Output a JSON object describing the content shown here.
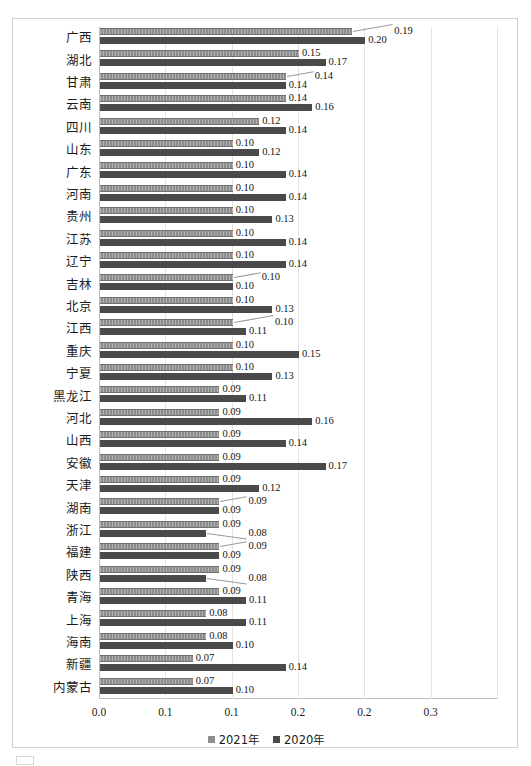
{
  "chart_data": {
    "type": "bar",
    "orientation": "horizontal",
    "title": "",
    "xlabel": "",
    "ylabel": "",
    "xlim": [
      0,
      0.3
    ],
    "xticks": [
      "0.0",
      "0.1",
      "0.1",
      "0.2",
      "0.2",
      "0.3"
    ],
    "xtick_values": [
      0.0,
      0.05,
      0.1,
      0.15,
      0.2,
      0.25,
      0.3
    ],
    "grid": true,
    "legend_position": "bottom",
    "categories": [
      "广西",
      "湖北",
      "甘肃",
      "云南",
      "四川",
      "山东",
      "广东",
      "河南",
      "贵州",
      "江苏",
      "辽宁",
      "吉林",
      "北京",
      "江西",
      "重庆",
      "宁夏",
      "黑龙江",
      "河北",
      "山西",
      "安徽",
      "天津",
      "湖南",
      "浙江",
      "福建",
      "陕西",
      "青海",
      "上海",
      "海南",
      "新疆",
      "内蒙古"
    ],
    "series": [
      {
        "name": "2021年",
        "color": "#8e8e8e",
        "values": [
          0.19,
          0.15,
          0.14,
          0.14,
          0.12,
          0.1,
          0.1,
          0.1,
          0.1,
          0.1,
          0.1,
          0.1,
          0.1,
          0.1,
          0.1,
          0.1,
          0.09,
          0.09,
          0.09,
          0.09,
          0.09,
          0.09,
          0.09,
          0.09,
          0.09,
          0.09,
          0.08,
          0.08,
          0.07,
          0.07
        ],
        "labels": [
          "0.19",
          "0.15",
          "0.14",
          "0.14",
          "0.12",
          "0.10",
          "0.10",
          "0.10",
          "0.10",
          "0.10",
          "0.10",
          "0.10",
          "0.10",
          "0.10",
          "0.10",
          "0.10",
          "0.09",
          "0.09",
          "0.09",
          "0.09",
          "0.09",
          "0.09",
          "0.09",
          "0.09",
          "0.09",
          "0.09",
          "0.08",
          "0.08",
          "0.07",
          "0.07"
        ]
      },
      {
        "name": "2020年",
        "color": "#4a4a4a",
        "values": [
          0.2,
          0.17,
          0.14,
          0.16,
          0.14,
          0.12,
          0.14,
          0.14,
          0.13,
          0.14,
          0.14,
          0.1,
          0.13,
          0.11,
          0.15,
          0.13,
          0.11,
          0.16,
          0.14,
          0.17,
          0.12,
          0.09,
          0.08,
          0.09,
          0.08,
          0.11,
          0.11,
          0.1,
          0.14,
          0.1
        ],
        "labels": [
          "0.20",
          "0.17",
          "0.14",
          "0.16",
          "0.14",
          "0.12",
          "0.14",
          "0.14",
          "0.13",
          "0.14",
          "0.14",
          "0.10",
          "0.13",
          "0.11",
          "0.15",
          "0.13",
          "0.11",
          "0.16",
          "0.14",
          "0.17",
          "0.12",
          "0.09",
          "0.08",
          "0.09",
          "0.08",
          "0.11",
          "0.11",
          "0.10",
          "0.14",
          "0.10"
        ]
      }
    ]
  },
  "legend": {
    "items": [
      {
        "label": "2021年",
        "swatch": "swatch-2021"
      },
      {
        "label": "2020年",
        "swatch": "swatch-2020"
      }
    ]
  },
  "caption": {
    "text": ""
  }
}
